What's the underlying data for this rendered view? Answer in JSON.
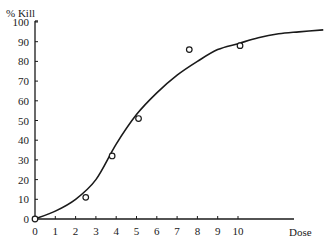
{
  "chart_data": {
    "type": "scatter",
    "title": "",
    "xlabel": "Dose",
    "ylabel": "% Kill",
    "xlim": [
      0,
      10
    ],
    "ylim": [
      0,
      100
    ],
    "x_ticks": [
      "0",
      "1",
      "2",
      "3",
      "4",
      "5",
      "6",
      "7",
      "8",
      "9",
      "10"
    ],
    "y_ticks": [
      "0",
      "10",
      "20",
      "30",
      "40",
      "50",
      "60",
      "70",
      "80",
      "90",
      "100"
    ],
    "grid": false,
    "legend": null,
    "series": [
      {
        "name": "Observed",
        "kind": "points",
        "marker": "open-circle",
        "x": [
          0,
          2.5,
          3.8,
          5.1,
          7.6,
          10.1
        ],
        "y": [
          0,
          11,
          32,
          51,
          86,
          88
        ]
      },
      {
        "name": "Fitted curve",
        "kind": "line",
        "x": [
          0,
          1,
          2,
          3,
          4,
          5,
          6,
          7,
          8,
          9,
          10,
          11,
          12,
          13,
          14.2
        ],
        "y": [
          0,
          4,
          10,
          20,
          38,
          53,
          64,
          73,
          80,
          86,
          89,
          92,
          94,
          95,
          96
        ]
      }
    ]
  },
  "labels": {
    "y_axis_title": "% Kill",
    "x_axis_title": "Dose"
  }
}
